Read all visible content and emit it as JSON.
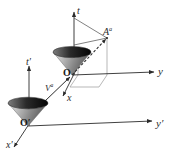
{
  "figure": {
    "background_color": "#ffffff",
    "ink_color": "#2b2b2b",
    "cone_dark_color": "#111111",
    "cone_mid_color": "#6e6e6e",
    "cone_light_color": "#d8d8d8"
  },
  "frames": {
    "unprimed": {
      "origin_label": "O",
      "axes": [
        {
          "name": "t-axis",
          "label": "t",
          "direction": "up"
        },
        {
          "name": "y-axis",
          "label": "y",
          "direction": "right"
        },
        {
          "name": "x-axis",
          "label": "x",
          "direction": "down-left"
        }
      ],
      "cone_name": "light-cone-unprimed",
      "vector": {
        "label": "A",
        "superscript": "a",
        "display": "Aᵃ",
        "style": "dashed-arrow-from-origin"
      },
      "projection": {
        "name": "projection-parallelogram",
        "style": "thin-solid-gray"
      }
    },
    "primed": {
      "origin_label": "O′",
      "axes": [
        {
          "name": "t-prime-axis",
          "label": "t′",
          "direction": "up"
        },
        {
          "name": "y-prime-axis",
          "label": "y′",
          "direction": "right"
        },
        {
          "name": "x-prime-axis",
          "label": "x′",
          "direction": "down-left"
        }
      ],
      "cone_name": "light-cone-primed"
    }
  },
  "connector": {
    "name": "boost-vector",
    "label": "V",
    "superscript": "a",
    "display": "Vᵃ",
    "style": "solid-arrow-toward-unprimed-origin"
  },
  "labels": {
    "t": "t",
    "t_prime": "t",
    "t_prime_mark": "′",
    "y": "y",
    "y_prime": "y",
    "y_prime_mark": "′",
    "x": "x",
    "x_prime": "x",
    "x_prime_mark": "′",
    "A": "A",
    "A_sup": "a",
    "V": "V",
    "V_sup": "a",
    "O": "O",
    "O_prime": "O′"
  }
}
